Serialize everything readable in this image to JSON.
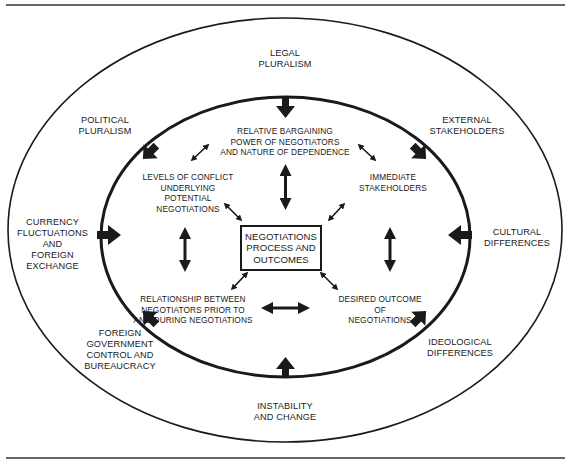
{
  "diagram": {
    "type": "concentric-ellipse influence diagram",
    "center": {
      "label": "NEGOTIATIONS\nPROCESS AND\nOUTCOMES"
    },
    "inner_factors": [
      {
        "id": "bargaining",
        "label": "RELATIVE BARGAINING\nPOWER OF NEGOTIATORS\nAND NATURE OF DEPENDENCE"
      },
      {
        "id": "conflict",
        "label": "LEVELS OF CONFLICT\nUNDERLYING\nPOTENTIAL\nNEGOTIATIONS"
      },
      {
        "id": "immediate",
        "label": "IMMEDIATE\nSTAKEHOLDERS"
      },
      {
        "id": "relationship",
        "label": "RELATIONSHIP BETWEEN\nNEGOTIATORS PRIOR TO\nAND DURING NEGOTIATIONS"
      },
      {
        "id": "desired",
        "label": "DESIRED OUTCOME\nOF\nNEGOTIATIONS"
      }
    ],
    "outer_factors": [
      {
        "id": "legal",
        "label": "LEGAL\nPLURALISM"
      },
      {
        "id": "political",
        "label": "POLITICAL\nPLURALISM"
      },
      {
        "id": "external",
        "label": "EXTERNAL\nSTAKEHOLDERS"
      },
      {
        "id": "currency",
        "label": "CURRENCY\nFLUCTUATIONS\nAND\nFOREIGN\nEXCHANGE"
      },
      {
        "id": "cultural",
        "label": "CULTURAL\nDIFFERENCES"
      },
      {
        "id": "foreign_gov",
        "label": "FOREIGN\nGOVERNMENT\nCONTROL AND\nBUREAUCRACY"
      },
      {
        "id": "ideological",
        "label": "IDEOLOGICAL\nDIFFERENCES"
      },
      {
        "id": "instability",
        "label": "INSTABILITY\nAND CHANGE"
      }
    ],
    "colors": {
      "ink": "#1a1a1a",
      "background": "#ffffff"
    }
  }
}
